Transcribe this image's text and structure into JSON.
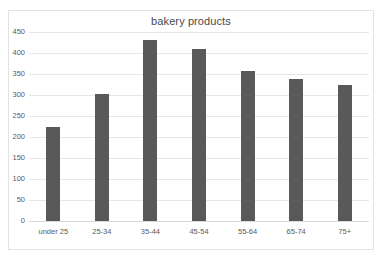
{
  "chart_data": {
    "type": "bar",
    "title": "bakery products",
    "xlabel": "",
    "ylabel": "",
    "categories": [
      "under 25",
      "25-34",
      "35-44",
      "45-54",
      "55-64",
      "65-74",
      "75+"
    ],
    "values": [
      225,
      303,
      430,
      410,
      358,
      337,
      325
    ],
    "ylim": [
      0,
      450
    ],
    "yticks": [
      0,
      50,
      100,
      150,
      200,
      250,
      300,
      350,
      400,
      450
    ],
    "ytick_labels": [
      "0",
      "50",
      "100",
      "150",
      "200",
      "250",
      "300",
      "350",
      "400",
      "450"
    ],
    "grid": true,
    "legend": false,
    "series": [
      {
        "name": "bakery products",
        "color": "#595959",
        "values": [
          225,
          303,
          430,
          410,
          358,
          337,
          325
        ]
      }
    ]
  },
  "colors": {
    "bar": "#595959",
    "gridline": "#e6e6e6",
    "border": "#e3e3e3",
    "text": "#5a5a5a",
    "title": "#4a4a4a",
    "background": "#ffffff"
  }
}
